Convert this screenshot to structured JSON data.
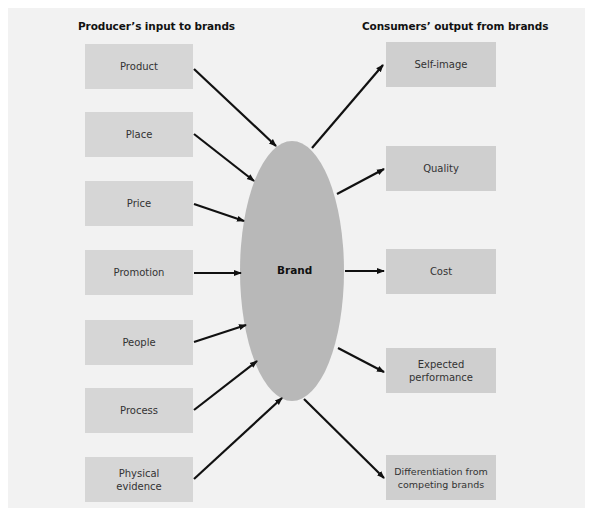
{
  "diagram": {
    "left_heading": "Producer’s input to brands",
    "right_heading": "Consumers’ output from brands",
    "center": {
      "label": "Brand",
      "color": "#b8b8b8"
    },
    "inputs": [
      {
        "label": "Product"
      },
      {
        "label": "Place"
      },
      {
        "label": "Price"
      },
      {
        "label": "Promotion"
      },
      {
        "label": "People"
      },
      {
        "label": "Process"
      },
      {
        "label": "Physical evidence"
      }
    ],
    "outputs": [
      {
        "label": "Self-image"
      },
      {
        "label": "Quality"
      },
      {
        "label": "Cost"
      },
      {
        "label": "Expected performance"
      },
      {
        "label": "Differentiation from competing brands"
      }
    ],
    "colors": {
      "background": "#f2f2f2",
      "box": "#d6d6d6",
      "ellipse": "#b8b8b8",
      "arrow": "#111111"
    }
  }
}
